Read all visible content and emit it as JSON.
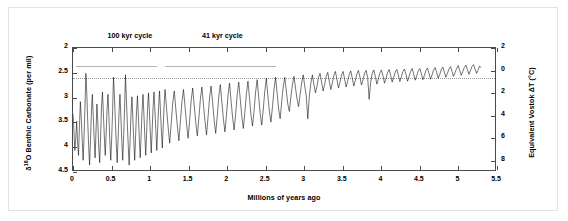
{
  "chart_data": {
    "type": "line",
    "title": "",
    "xlabel": "Millions of years ago",
    "ylabel": "δ O Benthic Carbonate (per mil)",
    "ylabel_left_prefix": "δ",
    "ylabel_left_sup": "18",
    "ylabel_left_rest": "O Benthic Carbonate (per mil)",
    "ylabel_right": "Equivalent Vostok ΔT (°C)",
    "xlim": [
      0,
      5.5
    ],
    "ylim_left": [
      4.5,
      2
    ],
    "ylim_right": [
      -9,
      2
    ],
    "y_left_inverted": true,
    "grid": false,
    "legend": "none",
    "xticks": [
      "0",
      "0.5",
      "1",
      "1.5",
      "2",
      "2.5",
      "3",
      "3.5",
      "4",
      "4.5",
      "5",
      "5.5"
    ],
    "xtick_values": [
      0,
      0.5,
      1,
      1.5,
      2,
      2.5,
      3,
      3.5,
      4,
      4.5,
      5,
      5.5
    ],
    "yticks_left": [
      "2",
      "2.5",
      "3",
      "3.5",
      "4",
      "4.5"
    ],
    "ytick_left_values": [
      2,
      2.5,
      3,
      3.5,
      4,
      4.5
    ],
    "yticks_right": [
      "2",
      "0",
      "2",
      "4",
      "6",
      "8"
    ],
    "ytick_right_values": [
      2,
      0,
      -2,
      -4,
      -6,
      -8
    ],
    "reference_line": {
      "label": "0 °C equivalent",
      "y_left_value": 2.6,
      "style": "dotted"
    },
    "annotations": [
      {
        "label": "100 kyr cycle",
        "x_center": 0.75,
        "span_start": 0.05,
        "span_end": 1.1,
        "y_left_value": 2.38
      },
      {
        "label": "41 kyr cycle",
        "x_center": 1.95,
        "span_start": 1.2,
        "span_end": 2.65,
        "y_left_value": 2.38
      }
    ],
    "series": [
      {
        "name": "δ18O benthic carbonate stack",
        "color": "#000000",
        "x": [
          0.0,
          0.012,
          0.024,
          0.036,
          0.048,
          0.06,
          0.072,
          0.084,
          0.096,
          0.108,
          0.12,
          0.132,
          0.144,
          0.156,
          0.168,
          0.18,
          0.192,
          0.204,
          0.216,
          0.228,
          0.24,
          0.252,
          0.264,
          0.276,
          0.288,
          0.3,
          0.312,
          0.324,
          0.336,
          0.348,
          0.36,
          0.372,
          0.384,
          0.396,
          0.408,
          0.42,
          0.432,
          0.444,
          0.456,
          0.468,
          0.48,
          0.492,
          0.504,
          0.516,
          0.528,
          0.54,
          0.552,
          0.564,
          0.576,
          0.588,
          0.6,
          0.612,
          0.624,
          0.636,
          0.648,
          0.66,
          0.672,
          0.684,
          0.696,
          0.708,
          0.72,
          0.732,
          0.744,
          0.756,
          0.768,
          0.78,
          0.792,
          0.804,
          0.816,
          0.828,
          0.84,
          0.852,
          0.864,
          0.876,
          0.888,
          0.9,
          0.912,
          0.924,
          0.936,
          0.948,
          0.96,
          0.972,
          0.984,
          0.996,
          1.008,
          1.02,
          1.032,
          1.044,
          1.056,
          1.068,
          1.08,
          1.092,
          1.104,
          1.116,
          1.128,
          1.14,
          1.152,
          1.164,
          1.176,
          1.188,
          1.2,
          1.22,
          1.24,
          1.26,
          1.28,
          1.3,
          1.32,
          1.34,
          1.36,
          1.38,
          1.4,
          1.42,
          1.44,
          1.46,
          1.48,
          1.5,
          1.52,
          1.54,
          1.56,
          1.58,
          1.6,
          1.62,
          1.64,
          1.66,
          1.68,
          1.7,
          1.72,
          1.74,
          1.76,
          1.78,
          1.8,
          1.82,
          1.84,
          1.86,
          1.88,
          1.9,
          1.92,
          1.94,
          1.96,
          1.98,
          2.0,
          2.02,
          2.04,
          2.06,
          2.08,
          2.1,
          2.12,
          2.14,
          2.16,
          2.18,
          2.2,
          2.22,
          2.24,
          2.26,
          2.28,
          2.3,
          2.32,
          2.34,
          2.36,
          2.38,
          2.4,
          2.42,
          2.44,
          2.46,
          2.48,
          2.5,
          2.52,
          2.54,
          2.56,
          2.58,
          2.6,
          2.62,
          2.64,
          2.66,
          2.68,
          2.7,
          2.72,
          2.74,
          2.76,
          2.78,
          2.8,
          2.82,
          2.84,
          2.86,
          2.88,
          2.9,
          2.92,
          2.94,
          2.96,
          2.98,
          3.0,
          3.02,
          3.04,
          3.06,
          3.08,
          3.1,
          3.12,
          3.14,
          3.16,
          3.18,
          3.2,
          3.22,
          3.24,
          3.26,
          3.28,
          3.3,
          3.32,
          3.34,
          3.36,
          3.38,
          3.4,
          3.42,
          3.44,
          3.46,
          3.48,
          3.5,
          3.52,
          3.54,
          3.56,
          3.58,
          3.6,
          3.62,
          3.64,
          3.66,
          3.68,
          3.7,
          3.72,
          3.74,
          3.76,
          3.78,
          3.8,
          3.82,
          3.84,
          3.86,
          3.88,
          3.9,
          3.92,
          3.94,
          3.96,
          3.98,
          4.0,
          4.02,
          4.04,
          4.06,
          4.08,
          4.1,
          4.12,
          4.14,
          4.16,
          4.18,
          4.2,
          4.22,
          4.24,
          4.26,
          4.28,
          4.3,
          4.32,
          4.34,
          4.36,
          4.38,
          4.4,
          4.42,
          4.44,
          4.46,
          4.48,
          4.5,
          4.52,
          4.54,
          4.56,
          4.58,
          4.6,
          4.62,
          4.64,
          4.66,
          4.68,
          4.7,
          4.72,
          4.74,
          4.76,
          4.78,
          4.8,
          4.82,
          4.84,
          4.86,
          4.88,
          4.9,
          4.92,
          4.94,
          4.96,
          4.98,
          5.0,
          5.02,
          5.04,
          5.06,
          5.08,
          5.1,
          5.12,
          5.14,
          5.16,
          5.18,
          5.2,
          5.22,
          5.24,
          5.26,
          5.28,
          5.3,
          5.32
        ],
        "y": [
          3.35,
          3.7,
          4.1,
          3.85,
          3.5,
          3.95,
          4.2,
          3.6,
          3.1,
          3.45,
          3.9,
          4.3,
          3.8,
          3.2,
          2.52,
          2.95,
          3.5,
          4.0,
          4.4,
          3.9,
          3.3,
          2.95,
          3.4,
          3.85,
          4.25,
          3.7,
          3.15,
          3.55,
          4.05,
          4.35,
          3.8,
          3.2,
          2.9,
          3.35,
          3.8,
          4.2,
          3.75,
          3.25,
          2.95,
          3.4,
          3.9,
          4.3,
          3.85,
          3.3,
          2.6,
          3.0,
          3.5,
          3.95,
          4.35,
          3.85,
          3.3,
          2.95,
          3.4,
          3.9,
          4.3,
          3.8,
          3.25,
          2.55,
          3.05,
          3.55,
          4.0,
          4.4,
          3.9,
          3.35,
          3.0,
          3.45,
          3.9,
          4.3,
          3.8,
          3.3,
          2.98,
          3.4,
          3.85,
          4.25,
          3.78,
          3.3,
          2.95,
          3.35,
          3.8,
          4.2,
          3.72,
          3.25,
          2.92,
          3.3,
          3.75,
          4.15,
          3.68,
          3.2,
          2.9,
          3.3,
          3.7,
          4.1,
          3.65,
          3.2,
          2.88,
          3.28,
          3.7,
          4.05,
          3.6,
          3.15,
          2.85,
          3.25,
          3.62,
          3.95,
          3.55,
          3.12,
          2.88,
          3.25,
          3.6,
          3.9,
          3.5,
          3.1,
          2.85,
          3.2,
          3.55,
          3.85,
          3.48,
          3.08,
          2.82,
          3.18,
          3.52,
          3.8,
          3.45,
          3.05,
          2.8,
          3.15,
          3.5,
          3.78,
          3.42,
          3.02,
          2.78,
          3.12,
          3.48,
          3.75,
          3.4,
          3.0,
          2.75,
          3.1,
          3.45,
          3.72,
          3.38,
          2.98,
          2.72,
          3.08,
          3.42,
          3.68,
          3.35,
          2.96,
          2.7,
          3.05,
          3.4,
          3.65,
          3.32,
          2.94,
          2.68,
          3.02,
          3.38,
          3.6,
          3.28,
          2.9,
          2.65,
          3.0,
          3.35,
          3.58,
          3.25,
          2.88,
          2.62,
          2.98,
          3.3,
          3.52,
          3.2,
          2.85,
          2.6,
          2.92,
          3.25,
          3.45,
          3.1,
          2.8,
          2.6,
          2.88,
          3.15,
          3.3,
          3.0,
          2.75,
          2.58,
          2.82,
          3.05,
          3.2,
          2.95,
          2.72,
          2.55,
          2.78,
          2.98,
          3.45,
          3.0,
          2.72,
          2.55,
          2.75,
          2.92,
          2.78,
          2.6,
          2.52,
          2.7,
          2.88,
          2.75,
          2.58,
          2.5,
          2.68,
          2.85,
          2.72,
          2.56,
          2.48,
          2.65,
          2.82,
          2.7,
          2.55,
          2.48,
          2.64,
          2.8,
          2.68,
          2.54,
          2.47,
          2.62,
          2.78,
          2.66,
          2.53,
          2.46,
          2.6,
          2.76,
          2.65,
          2.52,
          2.46,
          2.6,
          3.05,
          2.7,
          2.52,
          2.45,
          2.58,
          2.74,
          2.63,
          2.51,
          2.45,
          2.57,
          2.72,
          2.62,
          2.5,
          2.44,
          2.56,
          2.7,
          2.6,
          2.49,
          2.44,
          2.55,
          2.69,
          2.59,
          2.48,
          2.43,
          2.54,
          2.68,
          2.58,
          2.48,
          2.42,
          2.53,
          2.66,
          2.57,
          2.47,
          2.42,
          2.52,
          2.65,
          2.56,
          2.46,
          2.41,
          2.52,
          2.64,
          2.55,
          2.45,
          2.4,
          2.5,
          2.62,
          2.54,
          2.44,
          2.39,
          2.49,
          2.6,
          2.52,
          2.43,
          2.38,
          2.48,
          2.58,
          2.5,
          2.42,
          2.36,
          2.46,
          2.56,
          2.48,
          2.4,
          2.35,
          2.44,
          2.54,
          2.46,
          2.38,
          2.34,
          2.43,
          2.52,
          2.45,
          2.37,
          2.4
        ]
      }
    ]
  },
  "figure": {
    "background": "#ffffff",
    "frame_border_color": "#e2e2e2",
    "axis_color": "#4a4a4a",
    "line_color": "#000000"
  }
}
